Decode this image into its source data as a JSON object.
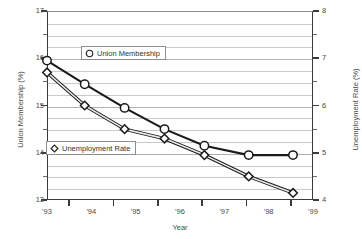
{
  "chart_data": {
    "type": "line",
    "title": "",
    "xlabel": "Year",
    "ylabel": "Union Membership (%)",
    "y2label": "Unemployment Rate (%)",
    "x": [
      "'93",
      "'94",
      "'95",
      "'96",
      "'97",
      "'98",
      "'99"
    ],
    "xlim": [
      1993,
      1999
    ],
    "ylim": [
      13,
      17
    ],
    "y2lim": [
      4,
      8
    ],
    "ytick_labels": [
      "17",
      "16",
      "15",
      "14",
      "13"
    ],
    "ytick_values": [
      17,
      16,
      15,
      14,
      13
    ],
    "y2tick_labels": [
      "8",
      "7",
      "6",
      "5",
      "4"
    ],
    "y2tick_values": [
      8,
      7,
      6,
      5,
      4
    ],
    "xtick_labels": [
      "'93",
      "'94",
      "'95",
      "'96",
      "'97",
      "'98",
      "'99"
    ],
    "grid": true,
    "minor_grid_step": 0.25,
    "legend_position": "inside",
    "series": [
      {
        "name": "Union Membership",
        "marker": "circle",
        "axis": "left",
        "x": [
          1993.0,
          1993.85,
          1994.75,
          1995.65,
          1996.55,
          1997.55,
          1998.55
        ],
        "values": [
          15.95,
          15.45,
          14.95,
          14.5,
          14.15,
          13.95,
          13.95
        ]
      },
      {
        "name": "Unemployment Rate",
        "marker": "diamond",
        "axis": "right",
        "x": [
          1993.0,
          1993.85,
          1994.75,
          1995.65,
          1996.55,
          1997.55,
          1998.55
        ],
        "values": [
          6.7,
          6.0,
          5.5,
          5.3,
          4.95,
          4.5,
          4.15
        ]
      }
    ]
  },
  "axes": {
    "left_title": "Union Membership (%)",
    "right_title": "Unemployment Rate (%)",
    "x_title": "Year",
    "left_ticks": [
      "17",
      "16",
      "15",
      "14",
      "13"
    ],
    "right_ticks": [
      "8",
      "7",
      "6",
      "5",
      "4"
    ],
    "x_ticks": [
      "'93",
      "'94",
      "'95",
      "'96",
      "'97",
      "'98",
      "'99"
    ]
  },
  "legend": {
    "union": {
      "label": "Union Membership",
      "marker": "circle-marker"
    },
    "unemployment": {
      "label": "Unemployment Rate",
      "marker": "diamond-marker"
    }
  },
  "colors": {
    "series_line": "#1a1a1a",
    "series_secondary_line": "#6b6b6b",
    "grid": "#c9c9c9",
    "axis": "#3b3b3b",
    "text": "#4a4a4a",
    "background": "#ffffff"
  }
}
